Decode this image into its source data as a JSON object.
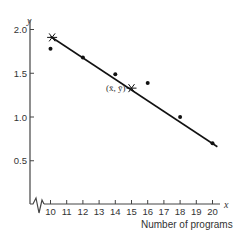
{
  "chart_data": {
    "type": "scatter",
    "title": "",
    "xlabel": "Number of programs",
    "ylabel": "",
    "x_var": "x",
    "y_var": "y",
    "xlim": [
      10,
      20
    ],
    "ylim": [
      0,
      2.0
    ],
    "x_axis_break": true,
    "grid": false,
    "xticks": [
      10,
      11,
      12,
      13,
      14,
      15,
      16,
      17,
      18,
      19,
      20
    ],
    "yticks": [
      0.5,
      1.0,
      1.5,
      2.0
    ],
    "ytick_labels": [
      "0.5",
      "1.0",
      "1.5",
      "2.0"
    ],
    "points": [
      {
        "x": 10,
        "y": 1.78
      },
      {
        "x": 12,
        "y": 1.68
      },
      {
        "x": 14,
        "y": 1.49
      },
      {
        "x": 16,
        "y": 1.39
      },
      {
        "x": 18,
        "y": 1.0
      },
      {
        "x": 20,
        "y": 0.7
      }
    ],
    "regression_line": {
      "x_start": 10,
      "y_start": 1.92,
      "x_end": 20.3,
      "y_end": 0.66
    },
    "star_markers": [
      {
        "x": 10.1,
        "y": 1.91
      },
      {
        "x": 15,
        "y": 1.33,
        "label": "(x̄, ȳ)"
      }
    ]
  }
}
